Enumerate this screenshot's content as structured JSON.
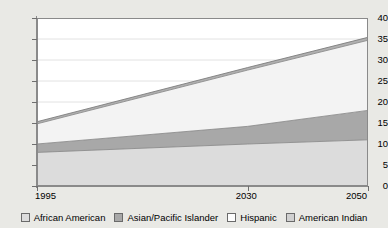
{
  "chart_data": {
    "type": "area",
    "title": "",
    "subtitle": "",
    "xlabel": "",
    "ylabel": "",
    "stacked": true,
    "grid": true,
    "grid_axis": "y",
    "legend_position": "bottom",
    "xlim": [
      1995,
      2050
    ],
    "ylim": [
      0,
      40
    ],
    "x": [
      1995,
      2030,
      2050
    ],
    "x_tick_labels": [
      "1995",
      "2030",
      "2050"
    ],
    "y_ticks": [
      0,
      5,
      10,
      15,
      20,
      25,
      30,
      35,
      40
    ],
    "y_tick_labels": [
      "0",
      "5",
      "10",
      "15",
      "20",
      "25",
      "30",
      "35",
      "40"
    ],
    "series": [
      {
        "name": "African American",
        "color": "#dcdcdc",
        "values": [
          8.0,
          10.0,
          11.0
        ],
        "cumulative": [
          8.0,
          10.0,
          11.0
        ]
      },
      {
        "name": "Asian/Pacific Islander",
        "color": "#a8a8a8",
        "values": [
          2.0,
          4.2,
          7.0
        ],
        "cumulative": [
          10.0,
          14.2,
          18.0
        ]
      },
      {
        "name": "Hispanic",
        "color": "#f3f3f3",
        "values": [
          4.8,
          13.4,
          16.7
        ],
        "cumulative": [
          14.8,
          27.6,
          34.7
        ]
      },
      {
        "name": "American Indian",
        "color": "#b0b0b0",
        "values": [
          0.5,
          0.6,
          0.7
        ],
        "cumulative": [
          15.3,
          28.2,
          35.4
        ]
      }
    ]
  },
  "legend": {
    "items": [
      {
        "label": "African American",
        "color": "#dcdcdc"
      },
      {
        "label": "Asian/Pacific Islander",
        "color": "#a8a8a8"
      },
      {
        "label": "Hispanic",
        "color": "#fdfdfd"
      },
      {
        "label": "American Indian",
        "color": "#d0d0d0"
      }
    ]
  },
  "axes": {
    "y_tick_labels": [
      "40",
      "35",
      "30",
      "25",
      "20",
      "15",
      "10",
      "5",
      "0"
    ],
    "x_tick_labels": [
      "1995",
      "2030",
      "2050"
    ]
  }
}
